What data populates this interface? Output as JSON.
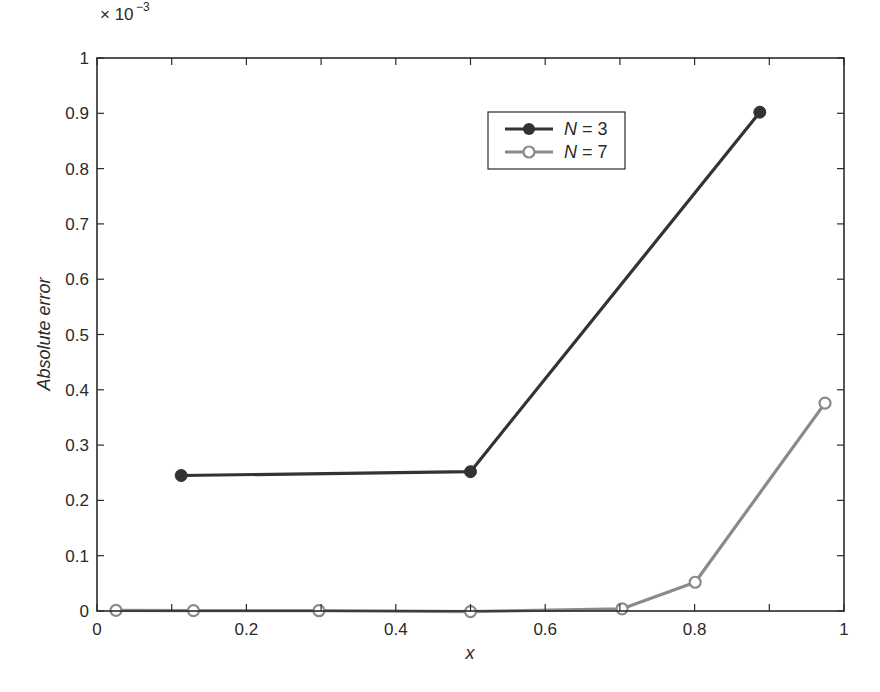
{
  "chart_data": {
    "type": "line",
    "title": "",
    "xlabel": "x",
    "ylabel": "Absolute error",
    "y_multiplier_label": "× 10",
    "y_multiplier_exponent": "−3",
    "xlim": [
      0,
      1
    ],
    "ylim": [
      0,
      1
    ],
    "y_scale": 0.001,
    "grid": false,
    "legend_position": "upper right (inside)",
    "x_ticks": [
      0,
      0.2,
      0.4,
      0.6,
      0.8,
      1
    ],
    "x_tick_labels": [
      "0",
      "0.2",
      "0.4",
      "0.6",
      "0.8",
      "1"
    ],
    "y_ticks": [
      0,
      0.1,
      0.2,
      0.3,
      0.4,
      0.5,
      0.6,
      0.7,
      0.8,
      0.9,
      1
    ],
    "y_tick_labels": [
      "0",
      "0.1",
      "0.2",
      "0.3",
      "0.4",
      "0.5",
      "0.6",
      "0.7",
      "0.8",
      "0.9",
      "1"
    ],
    "series": [
      {
        "name": "N = 3",
        "label_var": "N",
        "label_val": "= 3",
        "color": "#333333",
        "marker": "filled-circle",
        "x": [
          0.1127,
          0.5,
          0.8873
        ],
        "y": [
          0.245,
          0.252,
          0.902
        ]
      },
      {
        "name": "N = 7",
        "label_var": "N",
        "label_val": "= 7",
        "color": "#8a8a8a",
        "marker": "open-circle",
        "x": [
          0.0254,
          0.1292,
          0.2971,
          0.5,
          0.7029,
          0.8008,
          0.9746
        ],
        "y": [
          0.001,
          0.0008,
          0.0005,
          -0.001,
          0.004,
          0.052,
          0.376
        ]
      }
    ]
  }
}
